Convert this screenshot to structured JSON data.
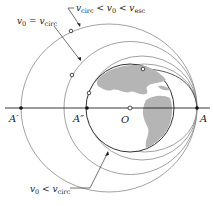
{
  "diagram": {
    "points": {
      "A": "A",
      "A_prime": "A′",
      "A_double_prime": "A″",
      "O": "O"
    },
    "labels": {
      "escape_band": {
        "v": "v",
        "sub0": "0",
        "lt1": " < ",
        "vc": "v",
        "subc": "circ",
        "lt2": " < ",
        "ve": "v",
        "sube": "esc"
      },
      "circular": {
        "v": "v",
        "sub0": "0",
        "eq": " = ",
        "vc": "v",
        "subc": "circ"
      },
      "suborbital": {
        "v": "v",
        "sub0": "0",
        "lt": " < ",
        "vc": "v",
        "subc": "circ"
      }
    },
    "colors": {
      "orbit_line": "#8a8a8a",
      "earth_outline": "#333333",
      "land": "#b5b5b5",
      "axis": "#222222"
    }
  }
}
